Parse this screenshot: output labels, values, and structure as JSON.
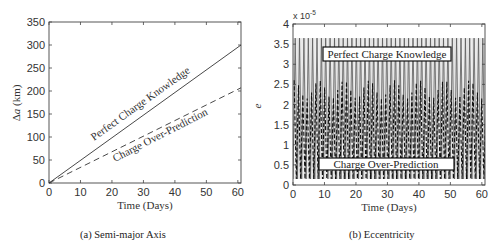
{
  "chart_data": [
    {
      "type": "line",
      "caption": "(a) Semi-major Axis",
      "title": "",
      "xlabel": "Time (Days)",
      "ylabel": "Δa (km)",
      "xlim": [
        0,
        61
      ],
      "ylim": [
        0,
        350
      ],
      "xticks": [
        0,
        10,
        20,
        30,
        40,
        50,
        60
      ],
      "yticks": [
        0,
        50,
        100,
        150,
        200,
        250,
        300,
        350
      ],
      "grid": false,
      "legend": "inline labels",
      "series": [
        {
          "name": "Perfect Charge Knowledge",
          "style": "solid",
          "x": [
            0,
            61
          ],
          "y": [
            0,
            300
          ]
        },
        {
          "name": "Charge Over-Prediction",
          "style": "dashed",
          "x": [
            0,
            61
          ],
          "y": [
            0,
            207
          ]
        }
      ]
    },
    {
      "type": "line",
      "caption": "(b) Eccentricity",
      "title": "",
      "xlabel": "Time (Days)",
      "ylabel": "e",
      "y_multiplier": "x 10^-5",
      "xlim": [
        0,
        61
      ],
      "ylim": [
        0,
        4
      ],
      "xticks": [
        0,
        10,
        20,
        30,
        40,
        50,
        60
      ],
      "yticks": [
        0,
        0.5,
        1,
        1.5,
        2,
        2.5,
        3,
        3.5,
        4
      ],
      "grid": false,
      "legend": "boxed labels",
      "series": [
        {
          "name": "Perfect Charge Knowledge",
          "style": "solid",
          "description": "rapid oscillation between ~0.1 and ~3.65 (x10^-5)",
          "min": 0.1,
          "max": 3.65
        },
        {
          "name": "Charge Over-Prediction",
          "style": "dashed",
          "description": "rapid oscillation between ~0.1 and ~2.6 (x10^-5), with periodic envelope",
          "min": 0.1,
          "max": 2.6
        }
      ]
    }
  ],
  "left": {
    "caption": "(a) Semi-major Axis",
    "xlabel": "Time (Days)",
    "ylabel_delta": "Δ",
    "ylabel_var": "a",
    "ylabel_unit": " (km)",
    "xticks": [
      "0",
      "10",
      "20",
      "30",
      "40",
      "50",
      "60"
    ],
    "yticks": [
      "0",
      "50",
      "100",
      "150",
      "200",
      "250",
      "300",
      "350"
    ],
    "label_solid": "Perfect Charge Knowledge",
    "label_dashed": "Charge Over-Prediction"
  },
  "right": {
    "caption": "(b) Eccentricity",
    "xlabel": "Time (Days)",
    "ylabel": "e",
    "multiplier_base": "x 10",
    "multiplier_exp": "-5",
    "xticks": [
      "0",
      "10",
      "20",
      "30",
      "40",
      "50",
      "60"
    ],
    "yticks": [
      "0",
      "0.5",
      "1",
      "1.5",
      "2",
      "2.5",
      "3",
      "3.5",
      "4"
    ],
    "label_solid": "Perfect Charge Knowledge",
    "label_dashed": "Charge Over-Prediction"
  }
}
